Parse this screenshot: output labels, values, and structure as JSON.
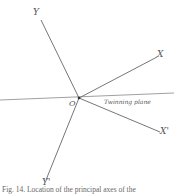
{
  "figure": {
    "axes": {
      "y": "Y",
      "x": "X",
      "x_prime": "X'",
      "y_prime": "Y'",
      "origin": "O"
    },
    "plane_label": "Twinning plane",
    "caption": "Fig. 14. Location of the principal axes of the",
    "line_color": "#777777"
  }
}
